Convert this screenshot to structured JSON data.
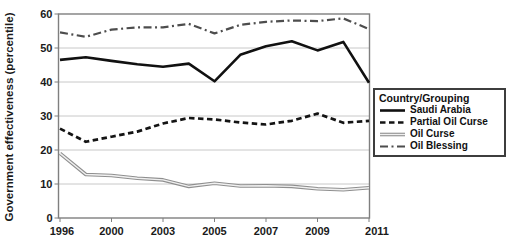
{
  "chart_data": {
    "type": "line",
    "title": "",
    "xlabel": "",
    "ylabel": "Government effectiveness (percentile)",
    "ylim": [
      0,
      60
    ],
    "y_ticks": [
      0,
      10,
      20,
      30,
      40,
      50,
      60
    ],
    "x": [
      1996,
      1998,
      2000,
      2002,
      2003,
      2004,
      2005,
      2006,
      2007,
      2008,
      2009,
      2010,
      2011
    ],
    "x_tick_labels": [
      "1996",
      "2000",
      "2003",
      "2005",
      "2007",
      "2009",
      "2011"
    ],
    "x_tick_indices": [
      0,
      2,
      4,
      6,
      8,
      10,
      12
    ],
    "grid": "horizontal",
    "legend_position": "right",
    "legend_title": "Country/Grouping",
    "colors": {
      "axis": "#7f7f7f",
      "gridline": "#c8c8c8",
      "text": "#1a1a1a",
      "background": "#ffffff"
    },
    "series": [
      {
        "name": "Saudi Arabia",
        "style": "solid",
        "color": "#111111",
        "width": 2.6,
        "dash": "",
        "values": [
          46.5,
          47.3,
          46.2,
          45.2,
          44.5,
          45.4,
          40.2,
          48.0,
          50.5,
          52.0,
          49.3,
          51.8,
          39.8
        ]
      },
      {
        "name": "Partial Oil Curse",
        "style": "dashed",
        "color": "#141414",
        "width": 2.7,
        "dash": "5.5 3.5",
        "values": [
          26.3,
          22.4,
          23.9,
          25.4,
          27.8,
          29.4,
          29.0,
          28.1,
          27.5,
          28.6,
          30.7,
          28.0,
          28.6
        ]
      },
      {
        "name": "Oil Curse",
        "style": "double",
        "color": "#8f8f8f",
        "width": 3.6,
        "dash": "",
        "values": [
          19.0,
          12.8,
          12.5,
          11.7,
          11.2,
          9.3,
          10.2,
          9.4,
          9.5,
          9.3,
          8.6,
          8.3,
          8.9
        ]
      },
      {
        "name": "Oil Blessing",
        "style": "dashdot",
        "color": "#4d4d4d",
        "width": 2.2,
        "dash": "8 3.5 2 3.5",
        "values": [
          54.6,
          53.3,
          55.4,
          56.1,
          56.1,
          57.1,
          54.3,
          56.8,
          57.7,
          58.1,
          57.9,
          58.7,
          55.6
        ]
      }
    ]
  }
}
